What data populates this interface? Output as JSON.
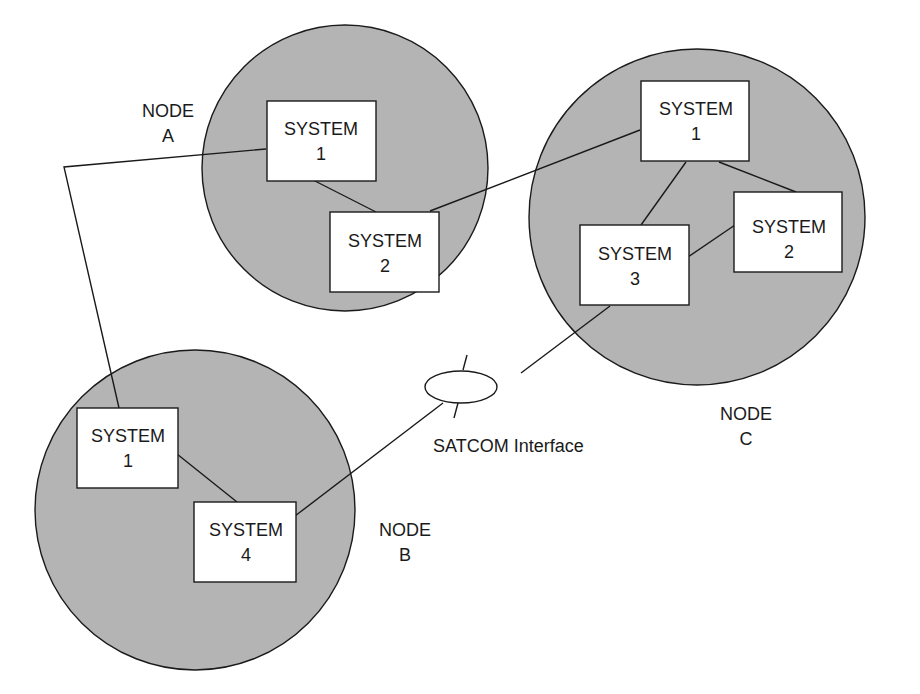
{
  "diagram": {
    "colors": {
      "node_fill": "#b4b4b4",
      "box_fill": "#ffffff",
      "stroke": "#1a1a1a"
    },
    "nodes": [
      {
        "id": "A",
        "label_line1": "NODE",
        "label_line2": "A"
      },
      {
        "id": "B",
        "label_line1": "NODE",
        "label_line2": "B"
      },
      {
        "id": "C",
        "label_line1": "NODE",
        "label_line2": "C"
      }
    ],
    "systems": {
      "a1": {
        "line1": "SYSTEM",
        "line2": "1"
      },
      "a2": {
        "line1": "SYSTEM",
        "line2": "2"
      },
      "c1": {
        "line1": "SYSTEM",
        "line2": "1"
      },
      "c2": {
        "line1": "SYSTEM",
        "line2": "2"
      },
      "c3": {
        "line1": "SYSTEM",
        "line2": "3"
      },
      "b1": {
        "line1": "SYSTEM",
        "line2": "1"
      },
      "b4": {
        "line1": "SYSTEM",
        "line2": "4"
      }
    },
    "satcom": {
      "label": "SATCOM Interface"
    },
    "connections": [
      [
        "A.SYSTEM 1",
        "A.SYSTEM 2"
      ],
      [
        "A.SYSTEM 1",
        "B.SYSTEM 1"
      ],
      [
        "A.SYSTEM 2",
        "C.SYSTEM 1"
      ],
      [
        "C.SYSTEM 1",
        "C.SYSTEM 2"
      ],
      [
        "C.SYSTEM 1",
        "C.SYSTEM 3"
      ],
      [
        "C.SYSTEM 3",
        "C.SYSTEM 2"
      ],
      [
        "C.SYSTEM 3",
        "SATCOM Interface"
      ],
      [
        "SATCOM Interface",
        "B.SYSTEM 4"
      ],
      [
        "B.SYSTEM 1",
        "B.SYSTEM 4"
      ]
    ]
  }
}
